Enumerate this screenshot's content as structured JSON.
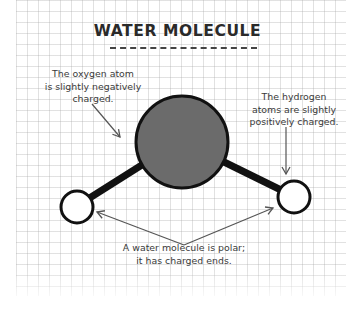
{
  "title": "WATER MOLECULE",
  "labels": {
    "oxygen": "The oxygen atom\nis slightly negatively\ncharged.",
    "hydrogen": "The hydrogen\natoms are slightly\npositively charged.",
    "polar": "A water molecule is polar;\nit has charged ends."
  },
  "molecule": {
    "oxygen_atom": {
      "label": "oxygen",
      "fill": "#6b6b6b",
      "stroke": "#111111"
    },
    "hydrogen_atoms": [
      {
        "label": "hydrogen-left",
        "fill": "#ffffff",
        "stroke": "#111111"
      },
      {
        "label": "hydrogen-right",
        "fill": "#ffffff",
        "stroke": "#111111"
      }
    ],
    "bond_color": "#111111"
  },
  "colors": {
    "text": "#3a3a3a",
    "title": "#2a2a2a",
    "grid": "#d4d4d4",
    "arrow": "#555555"
  }
}
